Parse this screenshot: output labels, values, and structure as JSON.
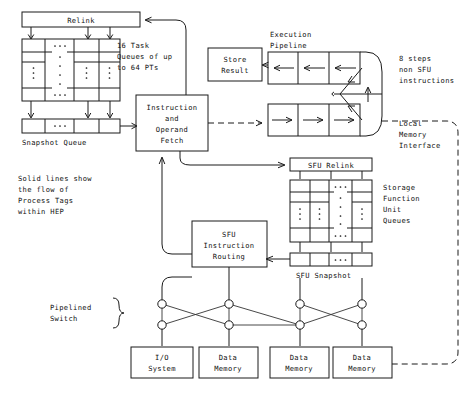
{
  "diagram": {
    "boxes": {
      "relink": "Relink",
      "snapshot_queue": "Snapshot Queue",
      "instruction_fetch": [
        "Instruction",
        "and",
        "Operand",
        "Fetch"
      ],
      "store_result": [
        "Store",
        "Result"
      ],
      "sfu_relink": "SFU Relink",
      "sfu_snapshot": "SFU Snapshot",
      "sfu_routing": [
        "SFU",
        "Instruction",
        "Routing"
      ],
      "io_system": [
        "I/O",
        "System"
      ],
      "data_memory_1": [
        "Data",
        "Memory"
      ],
      "data_memory_2": [
        "Data",
        "Memory"
      ],
      "data_memory_3": [
        "Data",
        "Memory"
      ]
    },
    "labels": {
      "task_queues": [
        "16 Task",
        "Queues of up",
        "to 64 PTs"
      ],
      "execution_pipeline": [
        "Execution",
        "Pipeline"
      ],
      "non_sfu_steps": [
        "8 steps",
        "non SFU",
        "instructions"
      ],
      "local_memory_interface": [
        "Local",
        "Memory",
        "Interface"
      ],
      "storage_function_unit_queues": [
        "Storage",
        "Function",
        "Unit",
        "Queues"
      ],
      "legend_note": [
        "Solid lines show",
        "the flow of",
        "Process Tags",
        "within HEP"
      ],
      "pipelined_switch": [
        "Pipelined",
        "Switch"
      ]
    },
    "ellipsis": {
      "horizontal": "· · ·",
      "vertical_dots": 3
    },
    "colors": {
      "stroke": "#1a1a1a",
      "background": "#ffffff",
      "text": "#111111"
    },
    "structure": {
      "task_queue_columns": 4,
      "task_queue_rows": 4,
      "snapshot_cells": 4,
      "sfu_queue_columns": 4,
      "sfu_snapshot_cells": 4,
      "switch_nodes_per_row": 4,
      "switch_rows": 2,
      "pipeline_stages": 3,
      "pipeline_rows": 2,
      "bottom_boxes": 4
    }
  }
}
